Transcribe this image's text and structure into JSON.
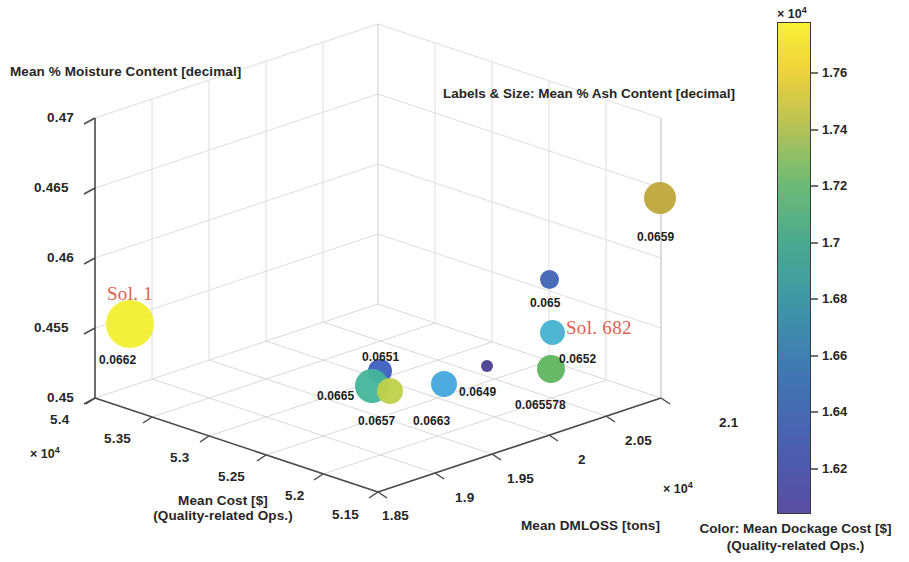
{
  "figure": {
    "annotation_note": "Labels & Size: Mean % Ash Content [decimal]",
    "annotation_color": "#e0604f"
  },
  "axes": {
    "x": {
      "title_line1": "Mean Cost [$]",
      "title_line2": "(Quality-related Ops.)",
      "exponent": "× 10",
      "exponent_power": "4",
      "ticks": [
        "5.4",
        "5.35",
        "5.3",
        "5.25",
        "5.2",
        "5.15"
      ],
      "range": [
        5.15,
        5.4
      ]
    },
    "y": {
      "title": "Mean % Moisture Content [decimal]",
      "ticks": [
        "0.47",
        "0.465",
        "0.46",
        "0.455",
        "0.45"
      ],
      "range": [
        0.45,
        0.47
      ]
    },
    "z": {
      "title": "Mean DMLOSS [tons]",
      "exponent": "× 10",
      "exponent_power": "4",
      "ticks": [
        "1.85",
        "1.9",
        "1.95",
        "2",
        "2.05",
        "2.1"
      ],
      "range": [
        1.85,
        2.1
      ]
    }
  },
  "colorbar": {
    "title_line1": "Color: Mean Dockage Cost [$]",
    "title_line2": "(Quality-related Ops.)",
    "exponent": "× 10",
    "exponent_power": "4",
    "ticks": [
      "1.76",
      "1.74",
      "1.72",
      "1.7",
      "1.68",
      "1.66",
      "1.64",
      "1.62"
    ],
    "tick_values": [
      1.76,
      1.74,
      1.72,
      1.7,
      1.68,
      1.66,
      1.64,
      1.62
    ],
    "range": [
      1.608,
      1.782
    ],
    "colors": [
      "#5a4fa2",
      "#4268ae",
      "#3f8fa8",
      "#4aa88b",
      "#86bf6b",
      "#ccc24b",
      "#f2d13a",
      "#f7f034"
    ]
  },
  "annotations": [
    {
      "text": "Sol. 1",
      "x": 107,
      "y": 283
    },
    {
      "text": "Sol. 682",
      "x": 566,
      "y": 317
    }
  ],
  "chart_data": {
    "type": "scatter",
    "title": "",
    "note": "Labels & Size: Mean % Ash Content [decimal]",
    "xlabel": "Mean Cost [$] (Quality-related Ops.)",
    "ylabel": "Mean % Moisture Content [decimal]",
    "zlabel": "Mean DMLOSS [tons]",
    "clabel": "Color: Mean Dockage Cost [$] (Quality-related Ops.)",
    "xlim": [
      5.15,
      5.4
    ],
    "ylim": [
      0.45,
      0.47
    ],
    "zlim": [
      1.85,
      2.1
    ],
    "clim": [
      1.608,
      1.782
    ],
    "x_exponent": 10000,
    "z_exponent": 10000,
    "c_exponent": 10000,
    "grid": true,
    "points": [
      {
        "label": "0.0662",
        "px": 130,
        "py": 324,
        "r": 24,
        "color": "#f2ef32",
        "ash": 0.0662,
        "label_px": 99,
        "label_py": 353,
        "solution": "Sol. 1"
      },
      {
        "label": "0.0659",
        "px": 660,
        "py": 198,
        "r": 16,
        "color": "#bfa63a",
        "ash": 0.0659,
        "label_px": 637,
        "label_py": 230
      },
      {
        "label": "0.065",
        "px": 549,
        "py": 279,
        "r": 9.5,
        "color": "#4063b4",
        "ash": 0.065,
        "label_px": 530,
        "label_py": 296
      },
      {
        "label": "0.0652",
        "px": 552,
        "py": 332,
        "r": 12.5,
        "color": "#45b2d0",
        "ash": 0.0652,
        "label_px": 559,
        "label_py": 352,
        "solution": "Sol. 682"
      },
      {
        "label": "0.065578",
        "px": 551,
        "py": 369,
        "r": 14,
        "color": "#5fb55f",
        "ash": 0.065578,
        "label_px": 515,
        "label_py": 398
      },
      {
        "label": "0.0649",
        "px": 487,
        "py": 366,
        "r": 6,
        "color": "#4a3f94",
        "ash": 0.0649,
        "label_px": 459,
        "label_py": 385
      },
      {
        "label": "0.0663",
        "px": 444,
        "py": 384,
        "r": 13,
        "color": "#45a7dd",
        "ash": 0.0663,
        "label_px": 413,
        "label_py": 414
      },
      {
        "label": "0.0651",
        "px": 380,
        "py": 371,
        "r": 12,
        "color": "#3b5fbd",
        "ash": 0.0651,
        "label_px": 362,
        "label_py": 350
      },
      {
        "label": "0.0665",
        "px": 372,
        "py": 386,
        "r": 17,
        "color": "#46b59b",
        "ash": 0.0665,
        "label_px": 317,
        "label_py": 389
      },
      {
        "label": "0.0657",
        "px": 390,
        "py": 391,
        "r": 13,
        "color": "#bfd14a",
        "ash": 0.0657,
        "label_px": 358,
        "label_py": 414
      }
    ]
  }
}
